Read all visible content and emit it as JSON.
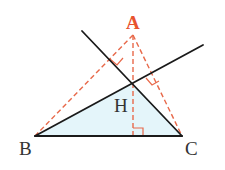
{
  "diagram": {
    "type": "triangle-orthocenter",
    "colors": {
      "solid_line": "#1a1a1a",
      "dashed_line": "#e8694a",
      "label_A": "#e8532f",
      "label_default": "#333333",
      "fill": "#e4f5fa"
    },
    "points": {
      "A": {
        "label": "A",
        "x": 133,
        "y": 33
      },
      "B": {
        "label": "B",
        "x": 35,
        "y": 136
      },
      "C": {
        "label": "C",
        "x": 182,
        "y": 136
      },
      "H": {
        "label": "H",
        "x": 133,
        "y": 83
      }
    },
    "labels": {
      "A": "A",
      "B": "B",
      "C": "C",
      "H": "H"
    },
    "segments": {
      "solid": [
        "BC",
        "B-H extended",
        "C-H extended"
      ],
      "dashed": [
        "AB",
        "AC",
        "AH (altitude to BC)"
      ]
    },
    "right_angle_markers": [
      "foot of altitude on BC",
      "foot of perpendicular on AB",
      "foot of perpendicular on AC"
    ],
    "filled_region": "triangle BHC"
  }
}
